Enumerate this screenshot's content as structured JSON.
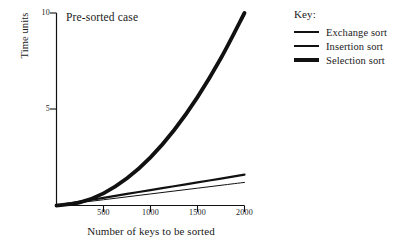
{
  "chart_data": {
    "type": "line",
    "title": "Pre-sorted case",
    "xlabel": "Number of keys to be sorted",
    "ylabel": "Time units",
    "xlim": [
      0,
      2000
    ],
    "ylim": [
      0,
      10
    ],
    "grid": false,
    "xticks": [
      500,
      1000,
      1500,
      2000
    ],
    "xtick_labels": [
      "500",
      "1000",
      "1500",
      "2000"
    ],
    "yticks": [
      5,
      10
    ],
    "ytick_labels": [
      "5",
      "10"
    ],
    "legend_position": "right",
    "legend_title": "Key:",
    "x": [
      0,
      250,
      500,
      750,
      1000,
      1250,
      1500,
      1750,
      2000
    ],
    "series": [
      {
        "name": "Exchange sort",
        "style": "thin",
        "linewidth": 1,
        "color": "#111111",
        "values": [
          0,
          0.15,
          0.3,
          0.45,
          0.6,
          0.75,
          0.9,
          1.05,
          1.2
        ]
      },
      {
        "name": "Insertion sort",
        "style": "medium",
        "linewidth": 2.2,
        "color": "#111111",
        "values": [
          0,
          0.2,
          0.4,
          0.6,
          0.8,
          1.0,
          1.2,
          1.4,
          1.6
        ]
      },
      {
        "name": "Selection sort",
        "style": "thick",
        "linewidth": 3.8,
        "color": "#111111",
        "values": [
          0,
          0.16,
          0.63,
          1.41,
          2.5,
          3.91,
          5.63,
          7.66,
          10.0
        ]
      }
    ]
  },
  "axes": {
    "title": "Pre-sorted case",
    "x_axis_label": "Number of keys to be sorted",
    "y_axis_label": "Time units",
    "x_tick_0": "500",
    "x_tick_1": "1000",
    "x_tick_2": "1500",
    "x_tick_3": "2000",
    "y_tick_0": "5",
    "y_tick_1": "10"
  },
  "legend": {
    "title": "Key:",
    "items": [
      {
        "label": "Exchange sort"
      },
      {
        "label": "Insertion sort"
      },
      {
        "label": "Selection sort"
      }
    ]
  },
  "colors": {
    "ink": "#111111",
    "background": "#ffffff"
  }
}
